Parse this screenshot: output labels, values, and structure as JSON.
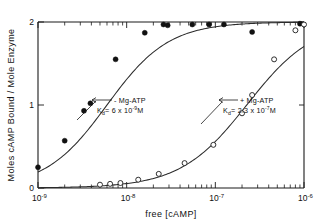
{
  "chart_data": {
    "type": "scatter",
    "title": "",
    "xlabel": "free [cAMP]",
    "ylabel": "Moles cAMP Bound / Mole Enzyme",
    "xscale": "log",
    "xlim": [
      1e-09,
      1e-06
    ],
    "ylim": [
      0,
      2
    ],
    "grid": false,
    "legend_position": "inline-annotations",
    "x_tick_labels": [
      {
        "mantissa": "10",
        "exponent": "-9",
        "value": 1e-09
      },
      {
        "mantissa": "10",
        "exponent": "-8",
        "value": 1e-08
      },
      {
        "mantissa": "10",
        "exponent": "-7",
        "value": 1e-07
      },
      {
        "mantissa": "10",
        "exponent": "-6",
        "value": 1e-06
      }
    ],
    "y_tick_labels": [
      "0",
      "1",
      "2"
    ],
    "y_tick_values": [
      0,
      1,
      2
    ],
    "series": [
      {
        "name": "- Mg-ATP",
        "marker": "filled-circle",
        "kd_label": "Kd = 6x10-9 M",
        "kd_prefix": "K",
        "kd_subscript": "d",
        "kd_equals": "= 6 x 10",
        "kd_exponent": "-9",
        "kd_units": "M",
        "points": [
          {
            "x": 1e-09,
            "y": 0.25
          },
          {
            "x": 2e-09,
            "y": 0.57
          },
          {
            "x": 3.3e-09,
            "y": 0.93
          },
          {
            "x": 3.9e-09,
            "y": 1.02
          },
          {
            "x": 7.5e-09,
            "y": 1.55
          },
          {
            "x": 1.6e-08,
            "y": 1.87
          },
          {
            "x": 2.6e-08,
            "y": 1.97
          },
          {
            "x": 2.9e-08,
            "y": 1.96
          },
          {
            "x": 5.5e-08,
            "y": 1.97
          },
          {
            "x": 8.5e-08,
            "y": 1.97
          },
          {
            "x": 1.25e-07,
            "y": 1.97
          },
          {
            "x": 2.6e-07,
            "y": 1.88
          },
          {
            "x": 9e-07,
            "y": 1.98
          }
        ]
      },
      {
        "name": "+ Mg-ATP",
        "marker": "open-circle",
        "kd_label": "Kd = 2.3x10-7 M",
        "kd_prefix": "K",
        "kd_subscript": "d",
        "kd_equals": "= 2.3 x 10",
        "kd_exponent": "-7",
        "kd_units": "M",
        "points": [
          {
            "x": 5e-09,
            "y": 0.04
          },
          {
            "x": 6.5e-09,
            "y": 0.05
          },
          {
            "x": 8.5e-09,
            "y": 0.06
          },
          {
            "x": 1.35e-08,
            "y": 0.1
          },
          {
            "x": 2.3e-08,
            "y": 0.17
          },
          {
            "x": 4.5e-08,
            "y": 0.3
          },
          {
            "x": 9.5e-08,
            "y": 0.52
          },
          {
            "x": 2e-07,
            "y": 0.9
          },
          {
            "x": 2.6e-07,
            "y": 1.12
          },
          {
            "x": 4.6e-07,
            "y": 1.55
          },
          {
            "x": 8e-07,
            "y": 1.9
          },
          {
            "x": 1e-06,
            "y": 1.97
          }
        ]
      }
    ],
    "annotations": [
      {
        "text": "- Mg-ATP",
        "series": 0
      },
      {
        "text": "+ Mg-ATP",
        "series": 1
      }
    ]
  }
}
